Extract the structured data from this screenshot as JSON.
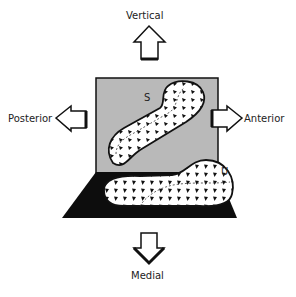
{
  "diagram": {
    "directions": {
      "top": "Vertical",
      "left": "Posterior",
      "right": "Anterior",
      "bottom": "Medial"
    },
    "structures": {
      "upper": "S",
      "lower": "U"
    },
    "colors": {
      "wall": "#b9b9b9",
      "floor": "#0d0d0d",
      "organ_fill": "#ffffff",
      "outline": "#111111"
    }
  }
}
